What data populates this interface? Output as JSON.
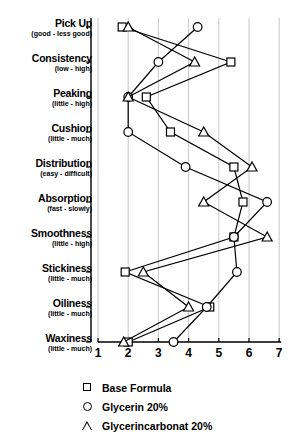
{
  "chart_data": {
    "type": "line",
    "title": "",
    "xlabel": "",
    "ylabel": "",
    "orientation": "horizontal",
    "xlim": [
      1,
      7
    ],
    "xticks": [
      1,
      2,
      3,
      4,
      5,
      6,
      7
    ],
    "grid": true,
    "legend_position": "bottom",
    "categories": [
      "Pick Up",
      "Consistency",
      "Peaking",
      "Cushion",
      "Distribution",
      "Absorption",
      "Smoothness",
      "Stickiness",
      "Oiliness",
      "Waxiness"
    ],
    "category_subtitles": [
      "(good - less good)",
      "(low - high)",
      "(little - high)",
      "(little - much)",
      "(easy - difficult)",
      "(fast - slowly)",
      "(little - high)",
      "(little - much)",
      "(little - much)",
      "(little - much)"
    ],
    "series": [
      {
        "name": "Base Formula",
        "marker": "square",
        "values": [
          1.8,
          5.4,
          2.6,
          3.4,
          5.5,
          5.8,
          5.5,
          1.9,
          4.7,
          2.0
        ]
      },
      {
        "name": "Glycerin 20%",
        "marker": "circle",
        "values": [
          4.3,
          3.0,
          2.0,
          2.0,
          3.9,
          6.6,
          5.5,
          5.6,
          4.6,
          3.5
        ]
      },
      {
        "name": "Glycerincarbonat 20%",
        "marker": "triangle",
        "values": [
          2.0,
          4.2,
          2.0,
          4.5,
          6.1,
          4.5,
          6.6,
          2.5,
          4.0,
          1.85
        ]
      }
    ]
  },
  "legend": {
    "items": [
      {
        "label": "Base Formula",
        "marker": "square"
      },
      {
        "label": "Glycerin 20%",
        "marker": "circle"
      },
      {
        "label": "Glycerincarbonat 20%",
        "marker": "triangle"
      }
    ]
  },
  "colors": {
    "line": "#000000",
    "marker_fill": "#ffffff",
    "grid": "#b9b9b9",
    "axis": "#000000"
  }
}
